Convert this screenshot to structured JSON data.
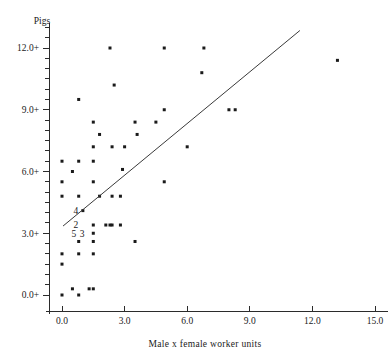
{
  "chart_data": {
    "type": "scatter",
    "title": "",
    "ylabel": "Pigs",
    "xlabel": "Male x female worker units",
    "xlim": [
      -0.75,
      15.6
    ],
    "ylim": [
      -0.9,
      13.2
    ],
    "grid": false,
    "legend": null,
    "x_ticks": [
      "0.0",
      "3.0",
      "6.0",
      "9.0",
      "12.0",
      "15.0"
    ],
    "x_tick_values": [
      0.0,
      3.0,
      6.0,
      9.0,
      12.0,
      15.0
    ],
    "y_ticks": [
      "0.0+",
      "3.0+",
      "6.0+",
      "9.0+",
      "12.0+"
    ],
    "y_tick_values": [
      0.0,
      3.0,
      6.0,
      9.0,
      12.0
    ],
    "y_minor_step": 0.5,
    "point_color": "#1a1a1a",
    "line_color": "#3a3a3a",
    "axis_color": "#2b2b2b",
    "points": [
      [
        0.0,
        0.0
      ],
      [
        0.0,
        2.0
      ],
      [
        0.0,
        1.5
      ],
      [
        0.0,
        4.8
      ],
      [
        0.0,
        5.5
      ],
      [
        0.0,
        6.5
      ],
      [
        0.5,
        0.3
      ],
      [
        0.5,
        6.0
      ],
      [
        0.8,
        0.0
      ],
      [
        0.8,
        2.0
      ],
      [
        0.8,
        2.6
      ],
      [
        0.8,
        4.8
      ],
      [
        0.8,
        6.5
      ],
      [
        0.8,
        9.5
      ],
      [
        1.0,
        4.1
      ],
      [
        1.3,
        0.3
      ],
      [
        1.5,
        0.3
      ],
      [
        1.5,
        2.0
      ],
      [
        1.5,
        2.6
      ],
      [
        1.5,
        3.0
      ],
      [
        1.5,
        3.4
      ],
      [
        1.5,
        5.5
      ],
      [
        1.5,
        6.5
      ],
      [
        1.5,
        7.2
      ],
      [
        1.5,
        8.4
      ],
      [
        1.8,
        4.8
      ],
      [
        1.8,
        7.8
      ],
      [
        2.1,
        3.4
      ],
      [
        2.3,
        3.4
      ],
      [
        2.4,
        3.4
      ],
      [
        2.4,
        4.8
      ],
      [
        2.4,
        7.2
      ],
      [
        2.3,
        12.0
      ],
      [
        2.5,
        10.2
      ],
      [
        2.8,
        3.4
      ],
      [
        2.8,
        4.8
      ],
      [
        2.9,
        6.1
      ],
      [
        3.0,
        7.2
      ],
      [
        3.5,
        2.6
      ],
      [
        3.5,
        8.4
      ],
      [
        3.6,
        7.8
      ],
      [
        4.5,
        8.4
      ],
      [
        4.9,
        5.5
      ],
      [
        4.9,
        9.0
      ],
      [
        4.9,
        12.0
      ],
      [
        6.0,
        7.2
      ],
      [
        6.7,
        10.8
      ],
      [
        6.8,
        12.0
      ],
      [
        8.0,
        9.0
      ],
      [
        8.3,
        9.0
      ],
      [
        13.2,
        11.4
      ]
    ],
    "overlap_labels": [
      {
        "text": "4",
        "x": 1.05,
        "y": 4.1
      },
      {
        "text": "2",
        "x": 1.05,
        "y": 3.4
      },
      {
        "text": "5",
        "x": 0.95,
        "y": 3.0
      },
      {
        "text": "3",
        "x": 1.35,
        "y": 3.0
      }
    ],
    "fit_line": {
      "x1": 0.05,
      "y1": 3.35,
      "x2": 11.4,
      "y2": 12.85
    }
  }
}
